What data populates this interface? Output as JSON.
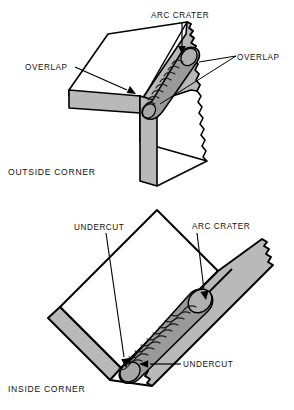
{
  "figure": {
    "kind": "welding-defect-diagram",
    "background_color": "#ffffff",
    "line_color": "#000000",
    "plate_face_color": "#b9b9b9",
    "plate_top_color": "#ffffff",
    "bead_color": "#9a9a9a",
    "panel_count": 2
  },
  "panels": [
    {
      "id": "outside-corner",
      "title": "OUTSIDE CORNER",
      "callouts": [
        {
          "id": "arc-crater",
          "text": "ARC CRATER",
          "position": "top-center"
        },
        {
          "id": "overlap-left",
          "text": "OVERLAP",
          "position": "left"
        },
        {
          "id": "overlap-right",
          "text": "OVERLAP",
          "position": "right"
        }
      ]
    },
    {
      "id": "inside-corner",
      "title": "INSIDE CORNER",
      "callouts": [
        {
          "id": "undercut-top",
          "text": "UNDERCUT",
          "position": "top-left"
        },
        {
          "id": "arc-crater",
          "text": "ARC CRATER",
          "position": "top-right"
        },
        {
          "id": "undercut-bottom",
          "text": "UNDERCUT",
          "position": "bottom-right"
        }
      ]
    }
  ],
  "outside": {
    "title": "OUTSIDE CORNER",
    "arc_crater": "ARC CRATER",
    "overlap_left": "OVERLAP",
    "overlap_right": "OVERLAP"
  },
  "inside": {
    "title": "INSIDE CORNER",
    "undercut_top": "UNDERCUT",
    "arc_crater": "ARC CRATER",
    "undercut_bottom": "UNDERCUT"
  }
}
